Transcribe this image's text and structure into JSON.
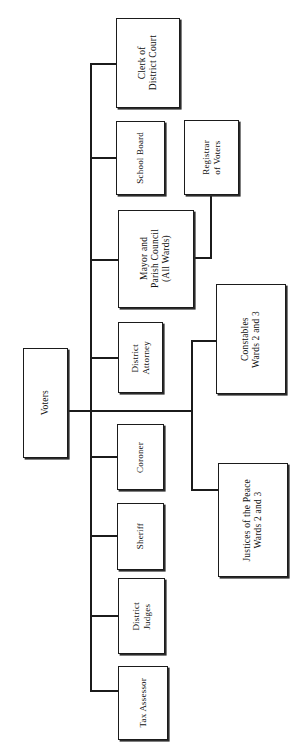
{
  "diagram": {
    "type": "organization-chart",
    "orientation": "rotated-90",
    "root": {
      "id": "voters",
      "label": "Voters"
    },
    "nodes": [
      {
        "id": "clerk-of-district-court",
        "label": "Clerk of\nDistrict Court",
        "parent": "voters"
      },
      {
        "id": "school-board",
        "label": "School Board",
        "parent": "voters"
      },
      {
        "id": "registrar-of-voters",
        "label": "Registrar\nof Voters",
        "parent": "mayor-and-parish-council"
      },
      {
        "id": "mayor-and-parish-council",
        "label": "Mayor and\nParish Council\n(All Wards)",
        "parent": "voters"
      },
      {
        "id": "district-attorney",
        "label": "District\nAttorney",
        "parent": "voters"
      },
      {
        "id": "constables-wards-2-and-3",
        "label": "Constables\nWards 2 and 3",
        "parent": "voters"
      },
      {
        "id": "coroner",
        "label": "Coroner",
        "parent": "voters"
      },
      {
        "id": "sheriff",
        "label": "Sheriff",
        "parent": "voters"
      },
      {
        "id": "justices-of-the-peace-wards-2-and-3",
        "label": "Justices of the Peace\nWards 2 and 3",
        "parent": "voters"
      },
      {
        "id": "district-judges",
        "label": "District\nJudges",
        "parent": "voters"
      },
      {
        "id": "tax-assessor",
        "label": "Tax Assessor",
        "parent": "voters"
      }
    ],
    "colors": {
      "stroke": "#1b1b1b",
      "fill": "#ffffff",
      "text": "#101010",
      "background": "#ffffff"
    }
  }
}
